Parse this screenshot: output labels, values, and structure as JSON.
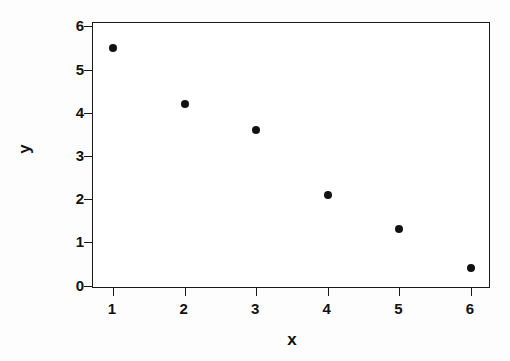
{
  "chart_data": {
    "type": "scatter",
    "title": "",
    "xlabel": "x",
    "ylabel": "y",
    "x": [
      1,
      2,
      3,
      4,
      5,
      6
    ],
    "values": [
      5.5,
      4.2,
      3.6,
      2.1,
      1.3,
      0.4
    ],
    "series": [
      {
        "name": "",
        "points": [
          {
            "x": 1,
            "y": 5.5
          },
          {
            "x": 2,
            "y": 4.2
          },
          {
            "x": 3,
            "y": 3.6
          },
          {
            "x": 4,
            "y": 2.1
          },
          {
            "x": 5,
            "y": 1.3
          },
          {
            "x": 6,
            "y": 0.4
          }
        ]
      }
    ],
    "xlim": [
      0.72,
      6.28
    ],
    "ylim": [
      -0.08,
      6.08
    ],
    "xticks": [
      1,
      2,
      3,
      4,
      5,
      6
    ],
    "yticks": [
      0,
      1,
      2,
      3,
      4,
      5,
      6
    ],
    "xtick_labels": [
      "1",
      "2",
      "3",
      "4",
      "5",
      "6"
    ],
    "ytick_labels": [
      "0",
      "1",
      "2",
      "3",
      "4",
      "5",
      "6"
    ],
    "grid": false,
    "legend": null,
    "marker": "filled-circle",
    "marker_color": "#111111",
    "frame_color": "#1a1a1a",
    "background": "#ffffff"
  }
}
